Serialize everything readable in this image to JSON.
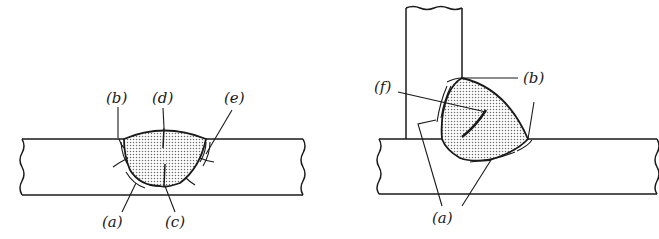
{
  "figure": {
    "left_diagram": {
      "name": "butt-weld",
      "labels": [
        {
          "id": "a",
          "text": "(a)"
        },
        {
          "id": "b",
          "text": "(b)"
        },
        {
          "id": "c",
          "text": "(c)"
        },
        {
          "id": "d",
          "text": "(d)"
        },
        {
          "id": "e",
          "text": "(e)"
        }
      ]
    },
    "right_diagram": {
      "name": "fillet-weld-t-joint",
      "labels": [
        {
          "id": "f",
          "text": "(f)"
        },
        {
          "id": "b",
          "text": "(b)"
        },
        {
          "id": "a",
          "text": "(a)"
        }
      ]
    },
    "colors": {
      "line": "#1a1a1a",
      "weld_fill": "#d8d8d8",
      "background": "#ffffff"
    }
  }
}
